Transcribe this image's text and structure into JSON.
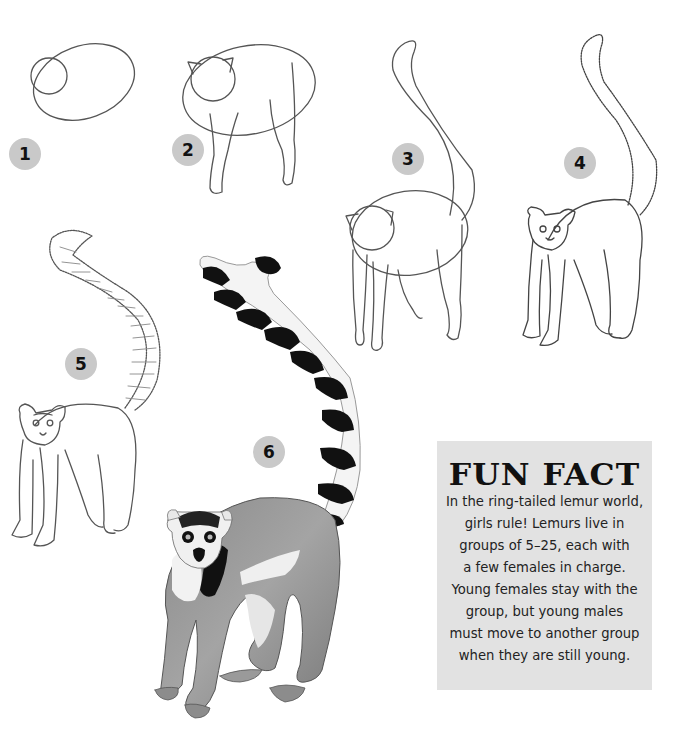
{
  "page": {
    "steps": [
      {
        "number": "1",
        "description": "Oval body with circle head"
      },
      {
        "number": "2",
        "description": "Add ears and legs"
      },
      {
        "number": "3",
        "description": "Add long curving tail"
      },
      {
        "number": "4",
        "description": "Add fur texture, face, and paws"
      },
      {
        "number": "5",
        "description": "Add tail rings and facial details"
      },
      {
        "number": "6",
        "description": "Shade the finished lemur"
      }
    ]
  },
  "fun_fact": {
    "title": "FUN FACT",
    "lines": [
      "In the ring-tailed lemur world,",
      "girls rule! Lemurs live in",
      "groups of 5–25, each with",
      "a few females in charge.",
      "Young females stay with the",
      "group, but young males",
      "must move to another group",
      "when they are still young."
    ]
  },
  "colors": {
    "background": "#ffffff",
    "badge": "#c9c9c9",
    "panel": "#e2e2e2",
    "ink": "#111111"
  }
}
